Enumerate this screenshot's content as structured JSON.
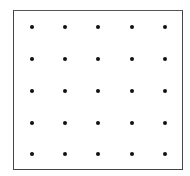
{
  "diagram": {
    "title": "",
    "type": "dot-grid",
    "rows": 5,
    "columns": 5,
    "dot_color": "#111111",
    "border_color": "#444444",
    "frame": {
      "left": 13,
      "top": 10,
      "right": 183,
      "bottom": 170
    },
    "column_x": [
      32,
      65,
      98,
      132,
      165
    ],
    "row_y": [
      27,
      59,
      91,
      123,
      154
    ]
  }
}
